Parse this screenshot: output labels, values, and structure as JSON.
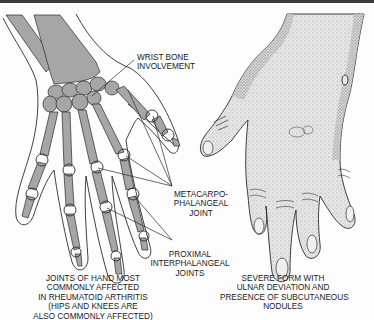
{
  "figure": {
    "colors": {
      "bone": "#a6a6a6",
      "outline": "#2a2a2a",
      "skin": "#dcdcdc",
      "background": "#fdfdfd",
      "top_border": "#3a3a3a"
    }
  },
  "labels": {
    "wrist_bone": [
      "WRIST BONE",
      "INVOLVEMENT"
    ],
    "mcp_joint": [
      "METACARPO-",
      "PHALANGEAL",
      "JOINT"
    ],
    "pip_joints": [
      "PROXIMAL",
      "INTERPHALANGEAL",
      "JOINTS"
    ]
  },
  "captions": {
    "left": [
      "JOINTS OF HAND MOST",
      "COMMONLY AFFECTED",
      "IN RHEUMATOID ARTHRITIS",
      "(HIPS AND KNEES ARE",
      "ALSO COMMONLY AFFECTED)"
    ],
    "right": [
      "SEVERE FORM WITH",
      "ULNAR DEVIATION AND",
      "PRESENCE OF SUBCUTANEOUS",
      "NODULES"
    ]
  },
  "panels": [
    {
      "name": "skeletal-hand",
      "description": "X-ray style hand showing bones and affected joints"
    },
    {
      "name": "deformed-hand",
      "description": "Stippled hand with ulnar deviation and nodules"
    }
  ]
}
